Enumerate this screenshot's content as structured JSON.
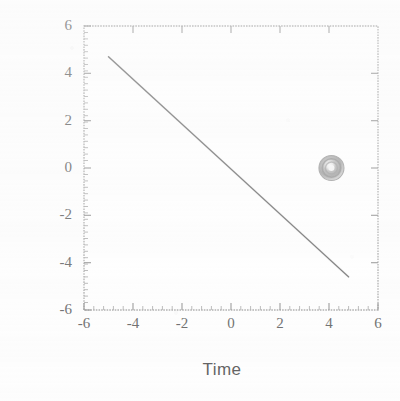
{
  "figure": {
    "background_color": "#fdfdfd",
    "frame_color": "#8a8a8a",
    "line_color": "#4a4a4a",
    "marker_color": "#8e8e8e",
    "text_color": "#3d3d3d"
  },
  "chart_data": {
    "type": "line",
    "title": "",
    "xlabel": "Time",
    "ylabel": "Frequency",
    "xlim": [
      -6,
      6
    ],
    "ylim": [
      -6,
      6
    ],
    "grid": false,
    "legend": "none",
    "x_ticks": [
      -6,
      -4,
      -2,
      0,
      2,
      4,
      6
    ],
    "y_ticks": [
      -6,
      -4,
      -2,
      0,
      2,
      4,
      6
    ],
    "x_tick_labels": [
      "-6",
      "-4",
      "-2",
      "0",
      "2",
      "4",
      "6"
    ],
    "y_tick_labels": [
      "-6",
      "-4",
      "-2",
      "0",
      "2",
      "4",
      "6"
    ],
    "minor_ticks": true,
    "series": [
      {
        "name": "line",
        "type": "line",
        "style": "solid",
        "x": [
          -5.0,
          -4.0,
          -3.0,
          -2.0,
          -1.0,
          0.0,
          1.0,
          2.0,
          3.0,
          4.0,
          4.8
        ],
        "y": [
          4.7,
          3.75,
          2.8,
          1.85,
          0.9,
          -0.05,
          -1.0,
          -1.95,
          -2.9,
          -3.85,
          -4.6
        ],
        "slope": -0.95,
        "intercept": -0.05
      },
      {
        "name": "marker",
        "type": "scatter",
        "marker": "circle-open-filled",
        "x": [
          4.1
        ],
        "y": [
          0.0
        ]
      }
    ]
  }
}
